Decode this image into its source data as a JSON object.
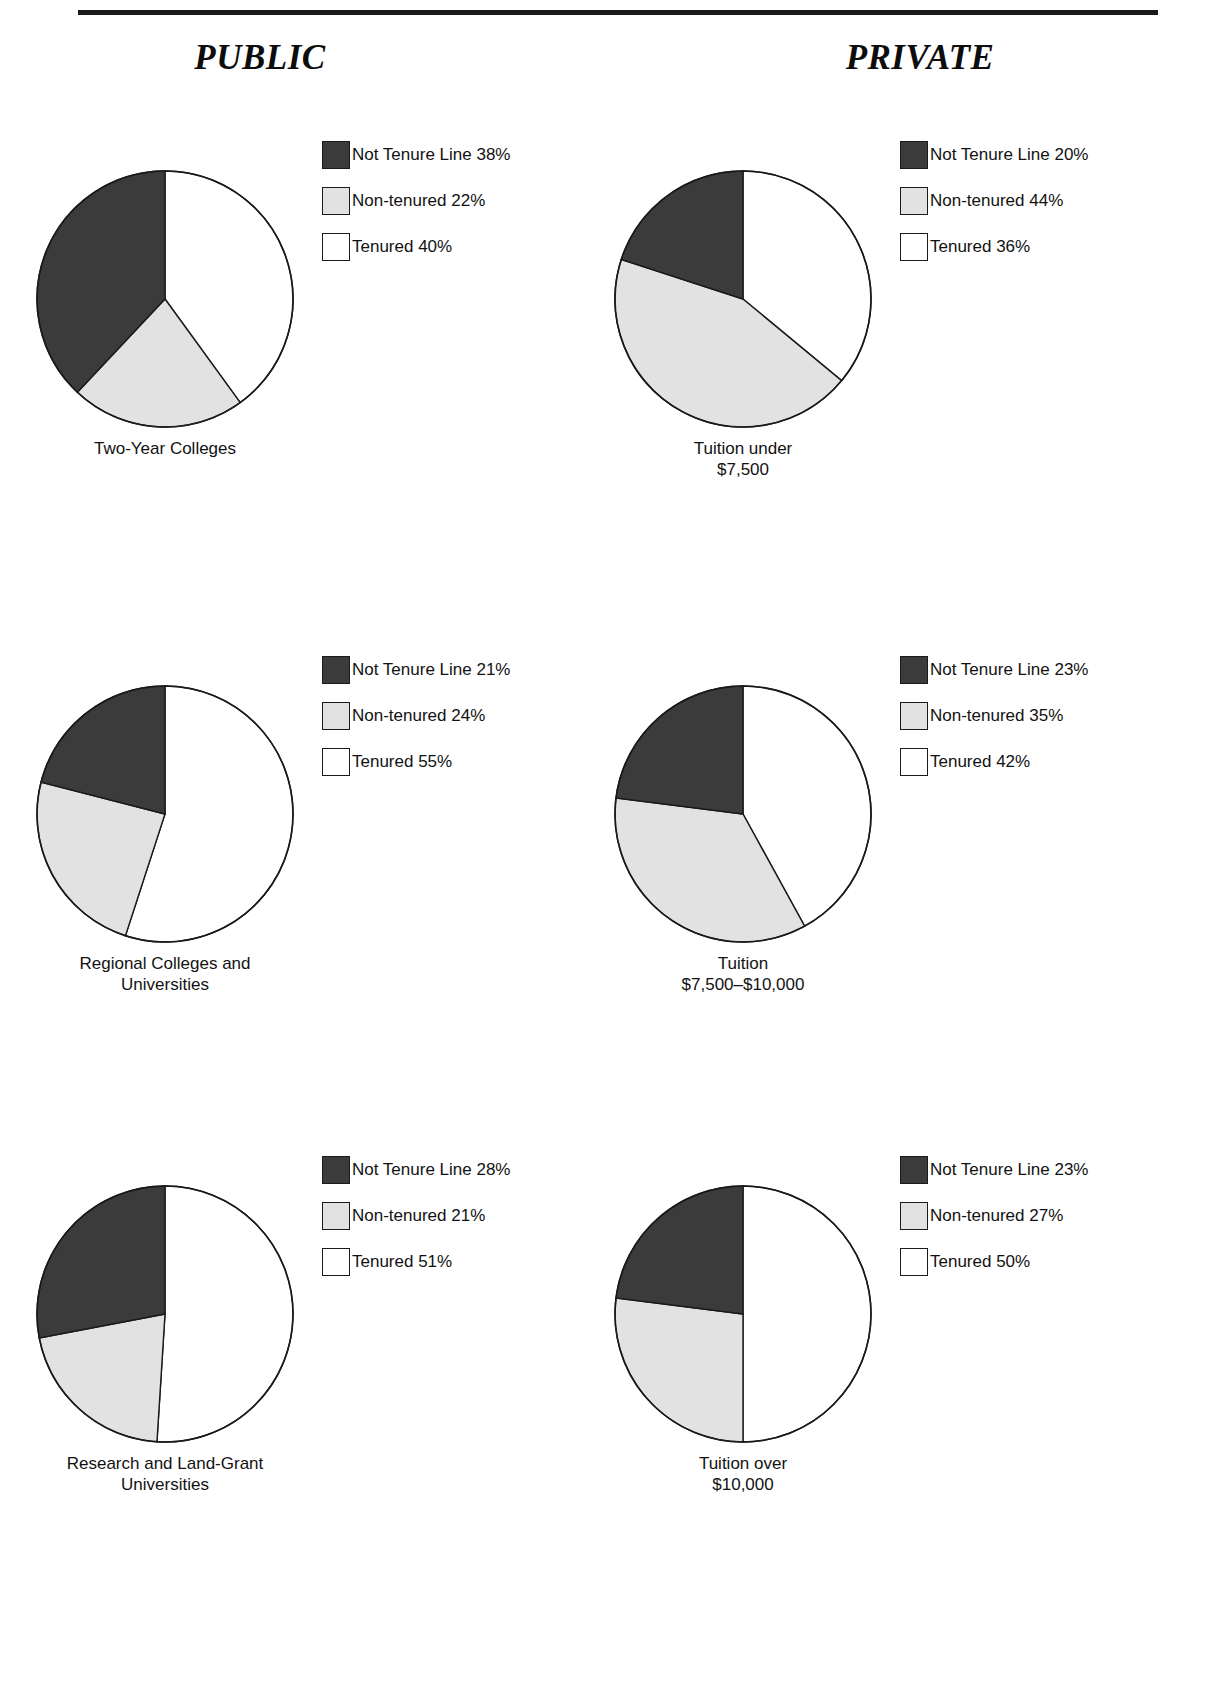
{
  "page": {
    "columns": [
      {
        "id": "public",
        "title": "PUBLIC"
      },
      {
        "id": "private",
        "title": "PRIVATE"
      }
    ],
    "legend_series": [
      "Not Tenure Line",
      "Non-tenured",
      "Tenured"
    ],
    "colors": {
      "not_tenure_line": "#3b3b3b",
      "non_tenured": "#e2e2e2",
      "tenured": "#ffffff",
      "outline": "#1a1a1a",
      "rule": "#1a1a1a",
      "text": "#121212"
    }
  },
  "charts": {
    "r0c0": {
      "caption": "Two-Year Colleges",
      "legend": [
        {
          "label": "Not Tenure Line 38%"
        },
        {
          "label": "Non-tenured 22%"
        },
        {
          "label": "Tenured 40%"
        }
      ]
    },
    "r0c1": {
      "caption": "Tuition under\n$7,500",
      "legend": [
        {
          "label": "Not Tenure Line 20%"
        },
        {
          "label": "Non-tenured 44%"
        },
        {
          "label": "Tenured 36%"
        }
      ]
    },
    "r1c0": {
      "caption": "Regional Colleges and\nUniversities",
      "legend": [
        {
          "label": "Not Tenure Line 21%"
        },
        {
          "label": "Non-tenured 24%"
        },
        {
          "label": "Tenured 55%"
        }
      ]
    },
    "r1c1": {
      "caption": "Tuition\n$7,500–$10,000",
      "legend": [
        {
          "label": "Not Tenure Line 23%"
        },
        {
          "label": "Non-tenured 35%"
        },
        {
          "label": "Tenured 42%"
        }
      ]
    },
    "r2c0": {
      "caption": "Research and Land-Grant\nUniversities",
      "legend": [
        {
          "label": "Not Tenure Line 28%"
        },
        {
          "label": "Non-tenured 21%"
        },
        {
          "label": "Tenured 51%"
        }
      ]
    },
    "r2c1": {
      "caption": "Tuition over\n$10,000",
      "legend": [
        {
          "label": "Not Tenure Line 23%"
        },
        {
          "label": "Non-tenured 27%"
        },
        {
          "label": "Tenured 50%"
        }
      ]
    }
  },
  "chart_data": [
    {
      "id": "r0c0",
      "type": "pie",
      "title": "Two-Year Colleges",
      "column": "PUBLIC",
      "labels": [
        "Tenured",
        "Non-tenured",
        "Not Tenure Line"
      ],
      "values": [
        40,
        22,
        38
      ],
      "colors": [
        "#ffffff",
        "#e2e2e2",
        "#3b3b3b"
      ],
      "units": "percent",
      "start_angle_deg": 0,
      "direction": "clockwise",
      "legend_position": "right"
    },
    {
      "id": "r0c1",
      "type": "pie",
      "title": "Tuition under $7,500",
      "column": "PRIVATE",
      "labels": [
        "Tenured",
        "Non-tenured",
        "Not Tenure Line"
      ],
      "values": [
        36,
        44,
        20
      ],
      "colors": [
        "#ffffff",
        "#e2e2e2",
        "#3b3b3b"
      ],
      "units": "percent",
      "start_angle_deg": 0,
      "direction": "clockwise",
      "legend_position": "right"
    },
    {
      "id": "r1c0",
      "type": "pie",
      "title": "Regional Colleges and Universities",
      "column": "PUBLIC",
      "labels": [
        "Tenured",
        "Non-tenured",
        "Not Tenure Line"
      ],
      "values": [
        55,
        24,
        21
      ],
      "colors": [
        "#ffffff",
        "#e2e2e2",
        "#3b3b3b"
      ],
      "units": "percent",
      "start_angle_deg": 0,
      "direction": "clockwise",
      "legend_position": "right"
    },
    {
      "id": "r1c1",
      "type": "pie",
      "title": "Tuition $7,500–$10,000",
      "column": "PRIVATE",
      "labels": [
        "Tenured",
        "Non-tenured",
        "Not Tenure Line"
      ],
      "values": [
        42,
        35,
        23
      ],
      "colors": [
        "#ffffff",
        "#e2e2e2",
        "#3b3b3b"
      ],
      "units": "percent",
      "start_angle_deg": 0,
      "direction": "clockwise",
      "legend_position": "right"
    },
    {
      "id": "r2c0",
      "type": "pie",
      "title": "Research and Land-Grant Universities",
      "column": "PUBLIC",
      "labels": [
        "Tenured",
        "Non-tenured",
        "Not Tenure Line"
      ],
      "values": [
        51,
        21,
        28
      ],
      "colors": [
        "#ffffff",
        "#e2e2e2",
        "#3b3b3b"
      ],
      "units": "percent",
      "start_angle_deg": 0,
      "direction": "clockwise",
      "legend_position": "right"
    },
    {
      "id": "r2c1",
      "type": "pie",
      "title": "Tuition over $10,000",
      "column": "PRIVATE",
      "labels": [
        "Tenured",
        "Non-tenured",
        "Not Tenure Line"
      ],
      "values": [
        50,
        27,
        23
      ],
      "colors": [
        "#ffffff",
        "#e2e2e2",
        "#3b3b3b"
      ],
      "units": "percent",
      "start_angle_deg": 0,
      "direction": "clockwise",
      "legend_position": "right"
    }
  ]
}
